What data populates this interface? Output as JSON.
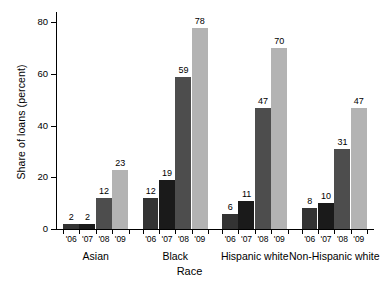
{
  "chart_data": {
    "type": "bar",
    "title": "",
    "xlabel": "Race",
    "ylabel": "Share of loans (percent)",
    "categories": [
      "Asian",
      "Black",
      "Hispanic white",
      "Non-Hispanic white"
    ],
    "subcategories": [
      "'06",
      "'07",
      "'08",
      "'09"
    ],
    "series": [
      {
        "name": "'06",
        "values": [
          2,
          12,
          6,
          8
        ],
        "color": "#333333"
      },
      {
        "name": "'07",
        "values": [
          2,
          19,
          11,
          10
        ],
        "color": "#1a1a1a"
      },
      {
        "name": "'08",
        "values": [
          12,
          59,
          47,
          31
        ],
        "color": "#4d4d4d"
      },
      {
        "name": "'09",
        "values": [
          23,
          78,
          70,
          47
        ],
        "color": "#b3b3b3"
      }
    ],
    "groups": [
      {
        "label": "Asian",
        "bars": [
          {
            "year": "'06",
            "value": 2
          },
          {
            "year": "'07",
            "value": 2
          },
          {
            "year": "'08",
            "value": 12
          },
          {
            "year": "'09",
            "value": 23
          }
        ]
      },
      {
        "label": "Black",
        "bars": [
          {
            "year": "'06",
            "value": 12
          },
          {
            "year": "'07",
            "value": 19
          },
          {
            "year": "'08",
            "value": 59
          },
          {
            "year": "'09",
            "value": 78
          }
        ]
      },
      {
        "label": "Hispanic white",
        "bars": [
          {
            "year": "'06",
            "value": 6
          },
          {
            "year": "'07",
            "value": 11
          },
          {
            "year": "'08",
            "value": 47
          },
          {
            "year": "'09",
            "value": 70
          }
        ]
      },
      {
        "label": "Non-Hispanic white",
        "bars": [
          {
            "year": "'06",
            "value": 8
          },
          {
            "year": "'07",
            "value": 10
          },
          {
            "year": "'08",
            "value": 31
          },
          {
            "year": "'09",
            "value": 47
          }
        ]
      }
    ],
    "ylim": [
      0,
      84
    ],
    "yticks": [
      0,
      20,
      40,
      60,
      80
    ],
    "ytick_labels": [
      "0",
      "20",
      "40",
      "60",
      "80"
    ],
    "grid": false,
    "legend": "none"
  }
}
